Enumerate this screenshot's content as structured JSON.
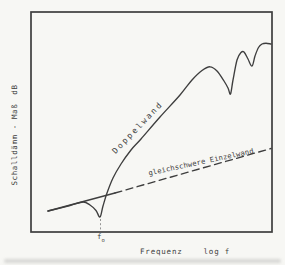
{
  "figure": {
    "bg": "#f7f7f4",
    "ink": "#3e3e3e",
    "y_axis": {
      "label": "Schalldämm - Maß",
      "unit": "dB"
    },
    "x_axis": {
      "label": "Frequenz",
      "unit": "log f"
    },
    "f0": {
      "base": "f",
      "sub": "o"
    }
  },
  "chart_data": {
    "type": "line",
    "xlabel": "Frequenz  log f",
    "ylabel": "Schalldämm - Maß  dB",
    "x_scale": "log",
    "axes_numeric": false,
    "grid": false,
    "plot_box_px": {
      "left": 31,
      "top": 12,
      "right": 272,
      "bottom": 232
    },
    "series": [
      {
        "name": "Doppelwand",
        "line_style": "solid",
        "points_px": [
          [
            48,
            211
          ],
          [
            70,
            205.5
          ],
          [
            83,
            202
          ],
          [
            90,
            205
          ],
          [
            96,
            210.5
          ],
          [
            100,
            217
          ],
          [
            103,
            206
          ],
          [
            107,
            193
          ],
          [
            113,
            178
          ],
          [
            121,
            164
          ],
          [
            131,
            150
          ],
          [
            141,
            139
          ],
          [
            160,
            117
          ],
          [
            180,
            95
          ],
          [
            192,
            80
          ],
          [
            202,
            70.5
          ],
          [
            210,
            66.8
          ],
          [
            217,
            71
          ],
          [
            224,
            81
          ],
          [
            228,
            88
          ],
          [
            230.5,
            94
          ],
          [
            233,
            80
          ],
          [
            237,
            60
          ],
          [
            241,
            52.5
          ],
          [
            244,
            52
          ],
          [
            248,
            59
          ],
          [
            252,
            66
          ],
          [
            255,
            56
          ],
          [
            258.5,
            47.5
          ],
          [
            262,
            44
          ],
          [
            266,
            43.2
          ],
          [
            271,
            44
          ]
        ]
      },
      {
        "name": "gleichschwere Einzelwand",
        "line_style": "dashed (drawn solid below f0 where it coincides with Doppelwand)",
        "solid_points_px": [
          [
            48,
            211
          ],
          [
            115,
            193
          ]
        ],
        "dashed_points_px": [
          [
            115,
            193
          ],
          [
            271,
            148.5
          ]
        ]
      }
    ],
    "markers": {
      "f0_px": {
        "x": 100.5,
        "y1": 219,
        "y2": 231.5
      }
    },
    "curve_labels": [
      {
        "text": "Doppelwand",
        "cx": 138,
        "cy": 128,
        "angle_deg": -46
      },
      {
        "text": "gleichschwere Einzelwand",
        "cx": 201,
        "cy": 162,
        "angle_deg": -12
      }
    ]
  }
}
